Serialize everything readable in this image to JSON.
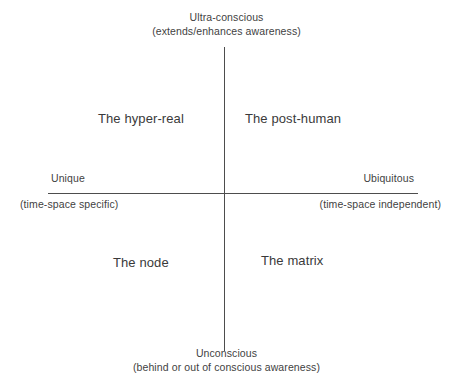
{
  "diagram": {
    "background_color": "#ffffff",
    "axis_color": "#4d4d4d",
    "text_color": "#3f3f3f",
    "vertical_axis": {
      "top_pole": {
        "main": "Ultra-conscious",
        "sub": "(extends/enhances awareness)"
      },
      "bottom_pole": {
        "main": "Unconscious",
        "sub": "(behind or out of conscious awareness)"
      }
    },
    "horizontal_axis": {
      "left_pole": {
        "main": "Unique",
        "sub": "(time-space specific)"
      },
      "right_pole": {
        "main": "Ubiquitous",
        "sub": "(time-space independent)"
      }
    },
    "quadrants": [
      {
        "position": "top-left",
        "label": "The hyper-real"
      },
      {
        "position": "top-right",
        "label": "The post-human"
      },
      {
        "position": "bottom-left",
        "label": "The node"
      },
      {
        "position": "bottom-right",
        "label": "The matrix"
      }
    ]
  }
}
